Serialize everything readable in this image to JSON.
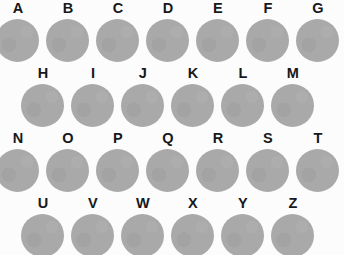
{
  "plate": {
    "background_color": "#fcfcfc",
    "disc_color": "#a9a9a9",
    "label_color": "#16181a",
    "disc_diameter_px": 43,
    "column_pitch_px": 50,
    "row_pitch_px": 65,
    "rows": [
      {
        "name": "row-1",
        "top": 0,
        "offset_x": -4,
        "items": [
          {
            "label": "A"
          },
          {
            "label": "B"
          },
          {
            "label": "C"
          },
          {
            "label": "D"
          },
          {
            "label": "E"
          },
          {
            "label": "F"
          },
          {
            "label": "G"
          }
        ]
      },
      {
        "name": "row-2",
        "top": 65,
        "offset_x": 21,
        "items": [
          {
            "label": "H"
          },
          {
            "label": "I"
          },
          {
            "label": "J"
          },
          {
            "label": "K"
          },
          {
            "label": "L"
          },
          {
            "label": "M"
          }
        ]
      },
      {
        "name": "row-3",
        "top": 130,
        "offset_x": -4,
        "items": [
          {
            "label": "N"
          },
          {
            "label": "O"
          },
          {
            "label": "P"
          },
          {
            "label": "Q"
          },
          {
            "label": "R"
          },
          {
            "label": "S"
          },
          {
            "label": "T"
          }
        ]
      },
      {
        "name": "row-4",
        "top": 195,
        "offset_x": 21,
        "items": [
          {
            "label": "U"
          },
          {
            "label": "V"
          },
          {
            "label": "W"
          },
          {
            "label": "X"
          },
          {
            "label": "Y"
          },
          {
            "label": "Z"
          }
        ]
      }
    ]
  }
}
